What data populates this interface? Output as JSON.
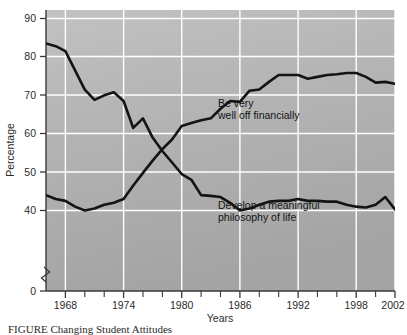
{
  "figure": {
    "caption": "FIGURE   Changing Student Attitudes",
    "y_axis_title": "Percentage",
    "x_axis_title": "Years"
  },
  "chart_data": {
    "type": "line",
    "title": "",
    "xlabel": "Years",
    "ylabel": "Percentage",
    "xlim": [
      1966,
      2002
    ],
    "ylim": [
      40,
      92
    ],
    "y_axis_break": true,
    "y_axis_break_note": "axis broken between 0 and 40",
    "grid": true,
    "grid_color": "#ffffff",
    "plot_background": "#b0b0b0",
    "line_color": "#141414",
    "xticks_major": [
      1968,
      1974,
      1980,
      1986,
      1992,
      1998,
      2002
    ],
    "xticks_minor": [
      1970,
      1972,
      1976,
      1978,
      1982,
      1984,
      1988,
      1990,
      1994,
      1996,
      2000
    ],
    "yticks": [
      0,
      40,
      50,
      60,
      70,
      80,
      90
    ],
    "legend_position": "inline-annotations",
    "x": [
      1966,
      1967,
      1968,
      1969,
      1970,
      1971,
      1972,
      1973,
      1974,
      1975,
      1976,
      1977,
      1978,
      1979,
      1980,
      1981,
      1982,
      1983,
      1984,
      1985,
      1986,
      1987,
      1988,
      1989,
      1990,
      1991,
      1992,
      1993,
      1994,
      1995,
      1996,
      1997,
      1998,
      1999,
      2000,
      2001,
      2002
    ],
    "series": [
      {
        "name": "Develop a meaningful philosophy of life",
        "annotation": "Develop a meaningful\nphilosophy of life",
        "annotation_line1": "Develop a meaningful",
        "annotation_line2": "philosophy of life",
        "values": [
          83.5,
          82.8,
          81.5,
          76.5,
          71.5,
          68.8,
          70.0,
          70.8,
          68.5,
          61.5,
          64.0,
          59.0,
          55.5,
          52.5,
          49.5,
          48.0,
          44.0,
          43.8,
          43.5,
          42.0,
          40.0,
          40.5,
          41.5,
          42.3,
          42.5,
          42.5,
          43.0,
          42.5,
          42.5,
          42.3,
          42.3,
          41.5,
          41.0,
          40.8,
          41.5,
          43.5,
          40.3
        ]
      },
      {
        "name": "Be very well off financially",
        "annotation": "Be very\nwell off financially",
        "annotation_line1": "Be very",
        "annotation_line2": "well off financially",
        "values": [
          44.0,
          43.0,
          42.5,
          41.0,
          40.0,
          40.5,
          41.5,
          42.0,
          43.0,
          46.5,
          49.8,
          53.0,
          56.0,
          58.5,
          62.0,
          62.8,
          63.5,
          64.0,
          66.5,
          68.5,
          68.3,
          71.2,
          71.5,
          73.5,
          75.3,
          75.3,
          75.3,
          74.3,
          74.8,
          75.3,
          75.5,
          75.8,
          75.8,
          74.8,
          73.3,
          73.5,
          73.0
        ]
      }
    ],
    "crossover_year": 1977,
    "crossover_value": 58.5
  }
}
